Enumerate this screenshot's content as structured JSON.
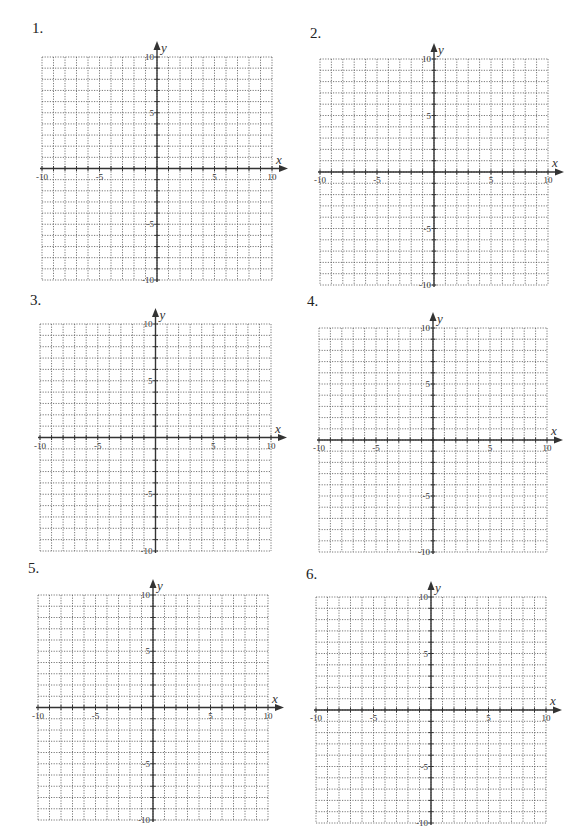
{
  "worksheet": {
    "problems": [
      {
        "number": "1.",
        "num_pos": [
          32,
          20
        ],
        "grid": {
          "left": 42,
          "top": 57,
          "right": 272,
          "bottom": 280
        }
      },
      {
        "number": "2.",
        "num_pos": [
          310,
          25
        ],
        "grid": {
          "left": 320,
          "top": 59,
          "right": 548,
          "bottom": 285
        }
      },
      {
        "number": "3.",
        "num_pos": [
          30,
          292
        ],
        "grid": {
          "left": 40,
          "top": 324,
          "right": 271,
          "bottom": 551
        }
      },
      {
        "number": "4.",
        "num_pos": [
          307,
          293
        ],
        "grid": {
          "left": 319,
          "top": 328,
          "right": 547,
          "bottom": 552
        }
      },
      {
        "number": "5.",
        "num_pos": [
          28,
          560
        ],
        "grid": {
          "left": 38,
          "top": 595,
          "right": 268,
          "bottom": 820
        }
      },
      {
        "number": "6.",
        "num_pos": [
          306,
          566
        ],
        "grid": {
          "left": 316,
          "top": 597,
          "right": 546,
          "bottom": 823
        }
      }
    ],
    "axis": {
      "x_label": "x",
      "y_label": "y",
      "min": -10,
      "max": 10,
      "step": 1,
      "tick_labels_x": [
        "-10",
        "-5",
        "5",
        "10"
      ],
      "tick_labels_y": [
        "10",
        "5",
        "-5",
        "-10"
      ]
    },
    "colors": {
      "grid": "#555555",
      "axis": "#333333",
      "background": "#ffffff"
    }
  },
  "chart_data": {
    "type": "scatter",
    "xlabel": "x",
    "ylabel": "y",
    "xlim": [
      -10,
      10
    ],
    "ylim": [
      -10,
      10
    ],
    "grid": true,
    "x_ticks": [
      -10,
      -5,
      5,
      10
    ],
    "y_ticks": [
      -10,
      -5,
      5,
      10
    ],
    "series": []
  }
}
